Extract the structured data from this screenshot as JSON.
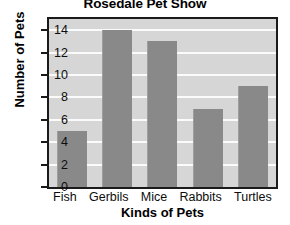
{
  "chart_data": {
    "type": "bar",
    "title": "Rosedale Pet Show",
    "xlabel": "Kinds of Pets",
    "ylabel": "Number of Pets",
    "categories": [
      "Fish",
      "Gerbils",
      "Mice",
      "Rabbits",
      "Turtles"
    ],
    "values": [
      5,
      14,
      13,
      7,
      9
    ],
    "ylim": [
      0,
      15
    ],
    "yticks": [
      0,
      2,
      4,
      6,
      8,
      10,
      12,
      14
    ],
    "ytick_labels": [
      "0",
      "2",
      "4",
      "6",
      "8",
      "10",
      "12",
      "14"
    ],
    "grid": true,
    "grid_axis": "y",
    "legend": false,
    "colors": {
      "bar": "#898989",
      "plot_background": "#d6d6d6",
      "gridline": "#fbfbfb",
      "frame": "#1a1a1a",
      "text": "#0d0d0d",
      "page_background": "#ffffff"
    }
  }
}
